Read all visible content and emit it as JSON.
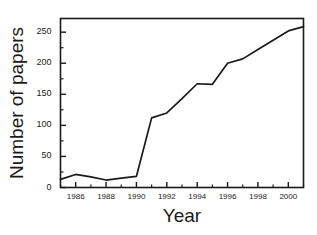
{
  "chart_data": {
    "type": "line",
    "title": "",
    "xlabel": "Year",
    "ylabel": "Number of papers",
    "x": [
      1985,
      1986,
      1987,
      1988,
      1989,
      1990,
      1991,
      1992,
      1993,
      1994,
      1995,
      1996,
      1997,
      1998,
      1999,
      2000,
      2001
    ],
    "values": [
      13,
      21,
      17,
      12,
      15,
      18,
      112,
      120,
      143,
      167,
      166,
      200,
      207,
      222,
      237,
      252,
      259
    ],
    "series": [
      {
        "name": "Number of papers",
        "values": [
          13,
          21,
          17,
          12,
          15,
          18,
          112,
          120,
          143,
          167,
          166,
          200,
          207,
          222,
          237,
          252,
          259
        ]
      }
    ],
    "xlim": [
      1985,
      2001
    ],
    "ylim": [
      0,
      272
    ],
    "x_major_ticks": [
      1986,
      1988,
      1990,
      1992,
      1994,
      1996,
      1998,
      2000
    ],
    "x_major_tick_labels": [
      "1986",
      "1988",
      "1990",
      "1992",
      "1994",
      "1996",
      "1998",
      "2000"
    ],
    "x_minor_ticks": [
      1985,
      1987,
      1989,
      1991,
      1993,
      1995,
      1997,
      1999,
      2001
    ],
    "y_major_ticks": [
      0,
      50,
      100,
      150,
      200,
      250
    ],
    "y_major_tick_labels": [
      "0",
      "50",
      "100",
      "150",
      "200",
      "250"
    ],
    "y_minor_ticks": [
      25,
      75,
      125,
      175,
      225
    ],
    "grid": false,
    "legend": false,
    "line_color": "#1a1a1a",
    "frame_color": "#1a1a1a",
    "background_color": "#ffffff"
  },
  "axis": {
    "y_title": "Number of papers",
    "x_title": "Year"
  }
}
